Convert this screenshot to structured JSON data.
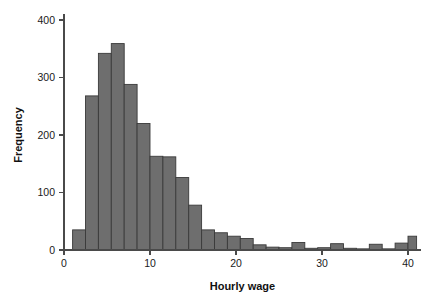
{
  "chart_data": {
    "type": "bar",
    "title": "",
    "subtitle": "",
    "xlabel": "Hourly wage",
    "ylabel": "Frequency",
    "xlim": [
      0,
      41.5
    ],
    "ylim": [
      0,
      420
    ],
    "grid": false,
    "legend": null,
    "bin_width": 1.5,
    "xticks": [
      0,
      10,
      20,
      30,
      40
    ],
    "xtick_labels": [
      "0",
      "10",
      "20",
      "30",
      "40"
    ],
    "yticks": [
      0,
      100,
      200,
      300,
      400
    ],
    "ytick_labels": [
      "0",
      "100",
      "200",
      "300",
      "400"
    ],
    "bar_fill": "#6e6e6e",
    "bar_stroke": "#3a3a3a",
    "bins": [
      {
        "x0": 1.0,
        "x1": 2.5,
        "value": 35
      },
      {
        "x0": 2.5,
        "x1": 4.0,
        "value": 268
      },
      {
        "x0": 4.0,
        "x1": 5.5,
        "value": 342
      },
      {
        "x0": 5.5,
        "x1": 7.0,
        "value": 359
      },
      {
        "x0": 7.0,
        "x1": 8.5,
        "value": 288
      },
      {
        "x0": 8.5,
        "x1": 10.0,
        "value": 220
      },
      {
        "x0": 10.0,
        "x1": 11.5,
        "value": 163
      },
      {
        "x0": 11.5,
        "x1": 13.0,
        "value": 162
      },
      {
        "x0": 13.0,
        "x1": 14.5,
        "value": 126
      },
      {
        "x0": 14.5,
        "x1": 16.0,
        "value": 78
      },
      {
        "x0": 16.0,
        "x1": 17.5,
        "value": 35
      },
      {
        "x0": 17.5,
        "x1": 19.0,
        "value": 30
      },
      {
        "x0": 19.0,
        "x1": 20.5,
        "value": 24
      },
      {
        "x0": 20.5,
        "x1": 22.0,
        "value": 20
      },
      {
        "x0": 22.0,
        "x1": 23.5,
        "value": 9
      },
      {
        "x0": 23.5,
        "x1": 25.0,
        "value": 5
      },
      {
        "x0": 25.0,
        "x1": 26.5,
        "value": 4
      },
      {
        "x0": 26.5,
        "x1": 28.0,
        "value": 13
      },
      {
        "x0": 28.0,
        "x1": 29.5,
        "value": 3
      },
      {
        "x0": 29.5,
        "x1": 31.0,
        "value": 4
      },
      {
        "x0": 31.0,
        "x1": 32.5,
        "value": 11
      },
      {
        "x0": 32.5,
        "x1": 34.0,
        "value": 3
      },
      {
        "x0": 34.0,
        "x1": 35.5,
        "value": 2
      },
      {
        "x0": 35.5,
        "x1": 37.0,
        "value": 10
      },
      {
        "x0": 37.0,
        "x1": 38.5,
        "value": 2
      },
      {
        "x0": 38.5,
        "x1": 40.0,
        "value": 12
      },
      {
        "x0": 40.0,
        "x1": 41.0,
        "value": 24
      }
    ]
  }
}
